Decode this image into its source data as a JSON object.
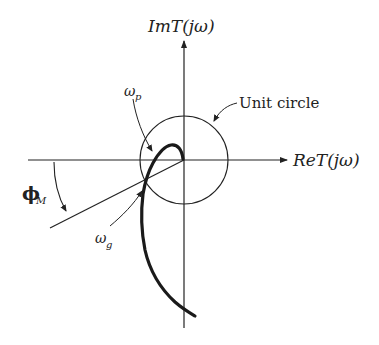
{
  "figure": {
    "type": "nyquist-phase-margin-diagram",
    "axes": {
      "vertical_label": "ImT(jω)",
      "horizontal_label": "ReT(jω)"
    },
    "labels": {
      "unit_circle": "Unit circle",
      "omega_p_main": "ω",
      "omega_p_sub": "p",
      "omega_g_main": "ω",
      "omega_g_sub": "g",
      "phase_margin_main": "ϕ",
      "phase_margin_sub": "M"
    },
    "colors": {
      "background": "#ffffff",
      "line": "#222222",
      "curve": "#1a1a1a"
    }
  }
}
